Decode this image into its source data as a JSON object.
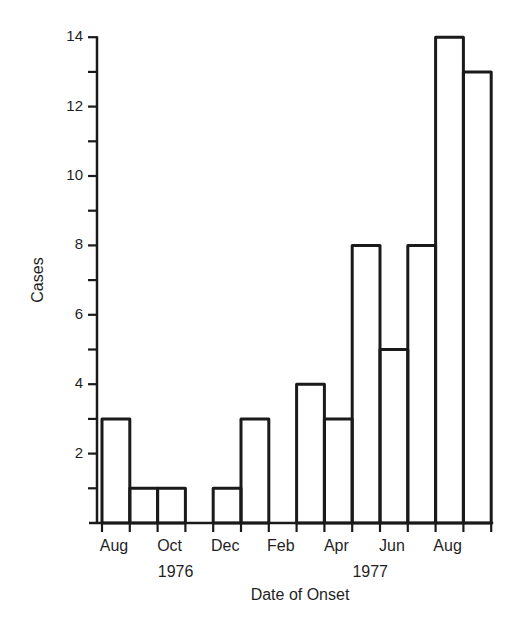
{
  "chart_data": {
    "type": "bar",
    "title": "",
    "xlabel": "Date of Onset",
    "ylabel": "Cases",
    "ylim": [
      0,
      14
    ],
    "yticks_major": [
      2,
      4,
      6,
      8,
      10,
      12,
      14
    ],
    "yticks_minor": [
      1,
      3,
      5,
      7,
      9,
      11,
      13
    ],
    "grid": false,
    "legend": null,
    "categories": [
      "Aug 1976",
      "Sep 1976",
      "Oct 1976",
      "Nov 1976",
      "Dec 1976",
      "Jan 1977",
      "Feb 1977",
      "Mar 1977",
      "Apr 1977",
      "May 1977",
      "Jun 1977",
      "Jul 1977",
      "Aug 1977",
      "Sep 1977"
    ],
    "values": [
      3,
      1,
      1,
      0,
      1,
      3,
      0,
      4,
      3,
      8,
      5,
      8,
      14,
      13
    ],
    "xtick_labels": [
      {
        "label": "Aug",
        "index": 0
      },
      {
        "label": "Oct",
        "index": 2
      },
      {
        "label": "Dec",
        "index": 4
      },
      {
        "label": "Feb",
        "index": 6
      },
      {
        "label": "Apr",
        "index": 8
      },
      {
        "label": "Jun",
        "index": 10
      },
      {
        "label": "Aug",
        "index": 12
      }
    ],
    "year_labels": [
      {
        "label": "1976",
        "index": 2
      },
      {
        "label": "1977",
        "index": 9
      }
    ],
    "style": "histogram, unfilled bars with black outlines"
  },
  "axes": {
    "ylabel": "Cases",
    "xlabel": "Date of Onset",
    "ytick_labels": [
      "2",
      "4",
      "6",
      "8",
      "10",
      "12",
      "14"
    ],
    "xtick_labels": [
      "Aug",
      "Oct",
      "Dec",
      "Feb",
      "Apr",
      "Jun",
      "Aug"
    ],
    "year_labels": [
      "1976",
      "1977"
    ]
  },
  "colors": {
    "ink": "#1a1a1a",
    "background": "#ffffff"
  }
}
